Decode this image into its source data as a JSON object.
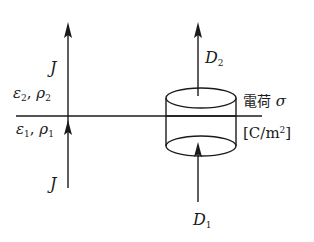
{
  "diagram": {
    "type": "boundary-condition-illustration",
    "boundary_line": {
      "y": 116,
      "x1": 16,
      "x2": 262
    },
    "left_current": {
      "label_upper": "J",
      "label_lower": "J",
      "x": 68,
      "y_bottom": 188,
      "y_top": 23,
      "arrowhead_mid_y": 127
    },
    "regions": {
      "upper": {
        "epsilon": "ε",
        "epsilon_sub": "2",
        "rho": "ρ",
        "rho_sub": "2",
        "separator": ", "
      },
      "lower": {
        "epsilon": "ε",
        "epsilon_sub": "1",
        "rho": "ρ",
        "rho_sub": "1",
        "separator": ", "
      }
    },
    "pillbox": {
      "cx": 201,
      "rx": 35,
      "ry": 10,
      "top_y": 98,
      "bottom_y": 146
    },
    "flux_upper": {
      "label_main": "D",
      "label_sub": "2",
      "x": 198,
      "y_from": 96,
      "y_to": 23
    },
    "flux_lower": {
      "label_main": "D",
      "label_sub": "1",
      "x": 198,
      "y_from": 200,
      "y_to": 144
    },
    "surface_charge": {
      "label_jp": "電荷",
      "symbol": "σ",
      "unit_open": "[C/m",
      "unit_sup": "2",
      "unit_close": "]"
    },
    "colors": {
      "line": "#1a1a1a",
      "background": "#ffffff"
    }
  }
}
